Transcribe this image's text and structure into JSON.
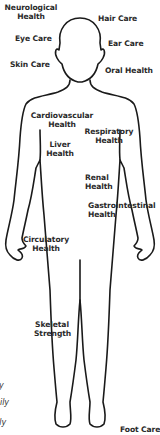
{
  "diagram": {
    "title": "",
    "outline_color": "#1a1a1a",
    "labels": {
      "neurological": [
        "Neurological",
        "Health"
      ],
      "hair": [
        "Hair Care"
      ],
      "eye": [
        "Eye Care"
      ],
      "ear": [
        "Ear Care"
      ],
      "skin": [
        "Skin Care"
      ],
      "oral": [
        "Oral Health"
      ],
      "cardiovascular": [
        "Cardiovascular",
        "Health"
      ],
      "respiratory": [
        "Respiratory",
        "Health"
      ],
      "liver": [
        "Liver",
        "Health"
      ],
      "renal": [
        "Renal",
        "Health"
      ],
      "gastrointestinal": [
        "Gastrointestinal",
        "Health"
      ],
      "circulatory": [
        "Circulatory",
        "Health"
      ],
      "skeletal": [
        "Skeletal",
        "Strength"
      ],
      "foot": [
        "Foot Care"
      ]
    },
    "cutoff_text": [
      "y",
      "aily",
      "ily"
    ]
  }
}
